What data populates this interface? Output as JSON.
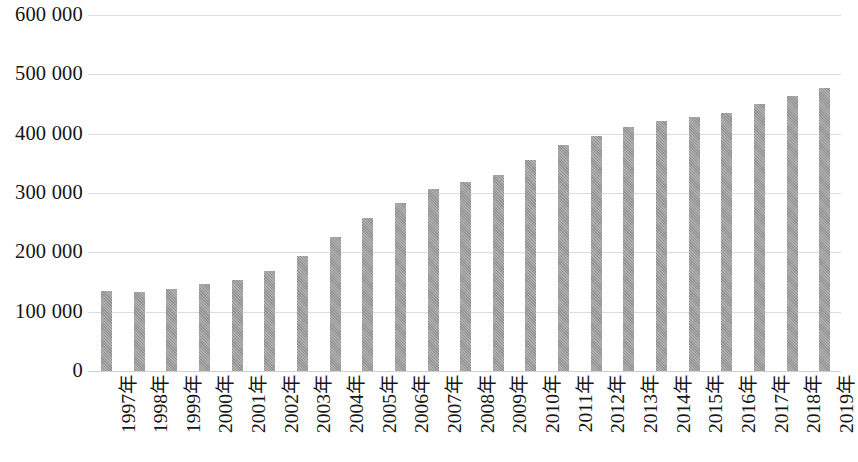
{
  "chart_data": {
    "type": "bar",
    "title": "",
    "subtitle": "",
    "xlabel": "",
    "ylabel": "",
    "grid": true,
    "legend": false,
    "ylim": [
      0,
      600000
    ],
    "ytick_labels": [
      "600 000",
      "500 000",
      "400 000",
      "300 000",
      "200 000",
      "100 000",
      "0"
    ],
    "ytick_values": [
      600000,
      500000,
      400000,
      300000,
      200000,
      100000,
      0
    ],
    "categories": [
      "1997年",
      "1998年",
      "1999年",
      "2000年",
      "2001年",
      "2002年",
      "2003年",
      "2004年",
      "2005年",
      "2006年",
      "2007年",
      "2008年",
      "2009年",
      "2010年",
      "2011年",
      "2012年",
      "2013年",
      "2014年",
      "2015年",
      "2016年",
      "2017年",
      "2018年",
      "2019年"
    ],
    "values": [
      135000,
      133000,
      138000,
      147000,
      154000,
      169000,
      194000,
      226000,
      258000,
      283000,
      307000,
      318000,
      331000,
      355000,
      381000,
      396000,
      412000,
      421000,
      428000,
      435000,
      450000,
      464000,
      477000
    ],
    "bar_color": "#9b9b9b",
    "gridline_color": "#dcdcdc",
    "axis_color": "#cfcfcf"
  }
}
